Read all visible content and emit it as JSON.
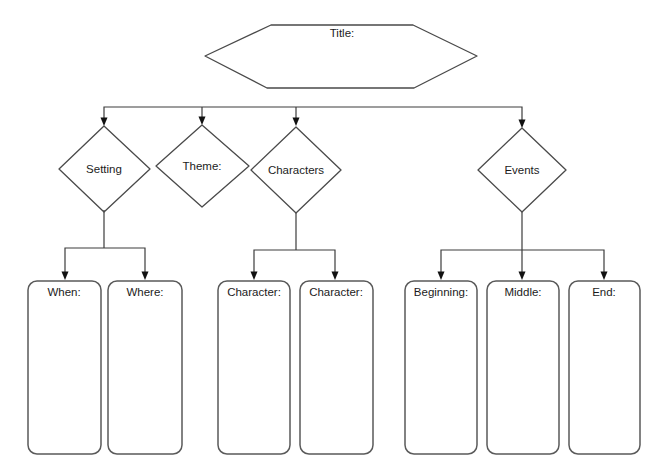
{
  "diagram": {
    "kind": "story-map-graphic-organizer",
    "title": {
      "label": "Title:"
    },
    "categories": [
      {
        "id": "setting",
        "label": "Setting"
      },
      {
        "id": "theme",
        "label": "Theme:"
      },
      {
        "id": "characters",
        "label": "Characters"
      },
      {
        "id": "events",
        "label": "Events"
      }
    ],
    "fields": [
      {
        "id": "when",
        "label": "When:",
        "parent": "setting"
      },
      {
        "id": "where",
        "label": "Where:",
        "parent": "setting"
      },
      {
        "id": "character1",
        "label": "Character:",
        "parent": "characters"
      },
      {
        "id": "character2",
        "label": "Character:",
        "parent": "characters"
      },
      {
        "id": "beginning",
        "label": "Beginning:",
        "parent": "events"
      },
      {
        "id": "middle",
        "label": "Middle:",
        "parent": "events"
      },
      {
        "id": "end",
        "label": "End:",
        "parent": "events"
      }
    ],
    "colors": {
      "background": "#ffffff",
      "line": "#3c3c3c",
      "shape": "#4a4a4a",
      "box": "#5a5a5a",
      "arrow": "#111111",
      "text": "#1c1c1c"
    }
  }
}
